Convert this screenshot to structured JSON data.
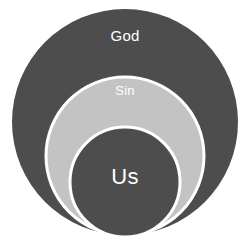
{
  "diagram": {
    "type": "nested-circles",
    "background_color": "#ffffff",
    "canvas": {
      "width": 250,
      "height": 250
    },
    "circles": [
      {
        "id": "god",
        "label": "God",
        "fill": "#4d4d4d",
        "stroke": "#ffffff",
        "stroke_width": 0,
        "cx": 125,
        "cy": 122,
        "r": 113,
        "label_x": 125,
        "label_y": 37,
        "label_color": "#ffffff",
        "label_size": 15
      },
      {
        "id": "sin",
        "label": "Sin",
        "fill": "#c3c3c3",
        "stroke": "#ffffff",
        "stroke_width": 3,
        "cx": 125,
        "cy": 156,
        "r": 79,
        "label_x": 125,
        "label_y": 92,
        "label_color": "#ffffff",
        "label_size": 13
      },
      {
        "id": "us",
        "label": "Us",
        "fill": "#4d4d4d",
        "stroke": "#ffffff",
        "stroke_width": 3,
        "cx": 125,
        "cy": 182,
        "r": 55,
        "label_x": 125,
        "label_y": 178,
        "label_color": "#ffffff",
        "label_size": 22
      }
    ]
  }
}
